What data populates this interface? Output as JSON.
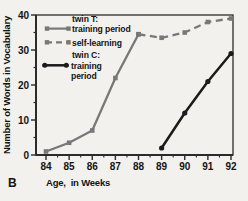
{
  "panel_label": "B",
  "axes": {
    "y_title": "Number of Words in Vocabulary",
    "x_title": "Age,  in Weeks",
    "y_ticks": [
      0,
      10,
      20,
      30,
      40
    ],
    "y_minor_ticks": [
      5,
      15,
      25,
      35
    ],
    "x_ticks": [
      84,
      85,
      86,
      87,
      88,
      89,
      90,
      91,
      92
    ],
    "x_minor_ticks": [
      84.5,
      85.5,
      86.5,
      87.5,
      88.5,
      89.5,
      90.5,
      91.5
    ]
  },
  "legend": {
    "twin_t": {
      "line1": "twin T:",
      "line2": "training period"
    },
    "self_learning": {
      "line1": "self-learning"
    },
    "twin_c": {
      "line1": "twin C:",
      "line2": "training",
      "line3": "period"
    }
  },
  "colors": {
    "gray": "#787878",
    "black": "#1b1b1b",
    "frame": "#2b2b2b",
    "text": "#141414",
    "background": "#f2f1ed"
  },
  "chart_data": {
    "type": "line",
    "title": "",
    "xlabel": "Age, in Weeks",
    "ylabel": "Number of Words in Vocabulary",
    "xlim": [
      84,
      92
    ],
    "ylim": [
      0,
      40
    ],
    "grid": false,
    "legend_position": "upper-left-inside",
    "series": [
      {
        "name": "twin T: training period",
        "style": "solid",
        "color": "gray",
        "marker": "square",
        "x": [
          84,
          85,
          86,
          87,
          88
        ],
        "y": [
          1,
          3.5,
          7,
          22,
          34.5
        ]
      },
      {
        "name": "self-learning",
        "style": "dashed",
        "color": "gray",
        "marker": "square",
        "x": [
          88,
          89,
          90,
          91,
          92
        ],
        "y": [
          34.5,
          33.5,
          35,
          38,
          39
        ]
      },
      {
        "name": "twin C: training period",
        "style": "solid",
        "color": "black",
        "marker": "circle",
        "x": [
          89,
          90,
          91,
          92
        ],
        "y": [
          2,
          12,
          21,
          29
        ]
      }
    ]
  }
}
